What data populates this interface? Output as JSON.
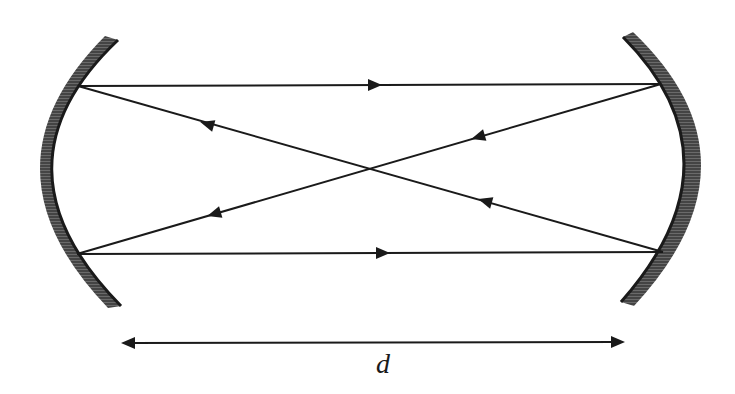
{
  "diagram": {
    "type": "optical resonator (bow-tie / crossed-beam cavity)",
    "colors": {
      "stroke": "#1a1a1a",
      "mirror_fill": "#555555",
      "mirror_hatch": "#2a2a2a",
      "background": "#ffffff"
    },
    "mirrors": [
      {
        "id": "left-mirror",
        "shape": "concave",
        "facing": "right"
      },
      {
        "id": "right-mirror",
        "shape": "concave",
        "facing": "left"
      }
    ],
    "rays": [
      {
        "id": "top-ray",
        "from": "left-top",
        "to": "right-top",
        "direction": "right"
      },
      {
        "id": "diagonal-down",
        "from": "right-bottom",
        "to": "left-top",
        "direction": "left-up"
      },
      {
        "id": "diagonal-up",
        "from": "right-top",
        "to": "left-bottom",
        "direction": "left-down"
      },
      {
        "id": "bottom-ray",
        "from": "left-bottom",
        "to": "right-bottom",
        "direction": "right"
      }
    ],
    "dimension": {
      "label": "d",
      "meaning": "mirror separation",
      "arrow": "double-headed"
    }
  }
}
